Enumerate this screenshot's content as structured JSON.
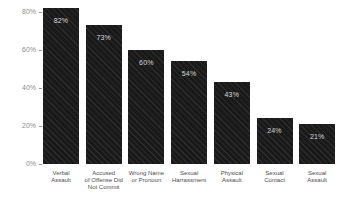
{
  "chart_data": {
    "type": "bar",
    "title": "",
    "xlabel": "",
    "ylabel": "",
    "categories": [
      "Verbal\nAssault",
      "Accused\nof Offense Did\nNot Commit",
      "Wrong Name\nor Pronoun",
      "Sexual\nHarrassment",
      "Physical\nAssault",
      "Sexual\nContact",
      "Sexual\nAssault"
    ],
    "values": [
      82,
      73,
      60,
      54,
      43,
      24,
      21
    ],
    "bar_labels": [
      "82%",
      "73%",
      "60%",
      "54%",
      "43%",
      "24%",
      "21%"
    ],
    "y_ticks": [
      {
        "label": "80%",
        "value": 80
      },
      {
        "label": "60%",
        "value": 60
      },
      {
        "label": "40%",
        "value": 40
      },
      {
        "label": "20%",
        "value": 20
      },
      {
        "label": "0%",
        "value": 0
      }
    ],
    "ylim": [
      0,
      86
    ],
    "grid": false,
    "legend": false,
    "colors": {
      "background": "#ffffff",
      "bar": "#1a1a1a",
      "bar_stripe": "#2a2a2a",
      "bar_value_label": "#d8d8d8",
      "axis_tick_label": "#8c8c8c",
      "category_label": "#4d4d4d"
    }
  }
}
